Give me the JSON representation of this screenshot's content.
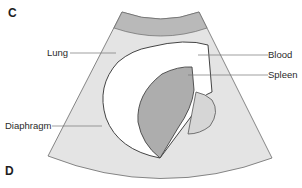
{
  "figure": {
    "panel_top": "C",
    "panel_bottom": "D",
    "labels": {
      "lung": "Lung",
      "blood": "Blood",
      "spleen": "Spleen",
      "diaphragm": "Diaphragm"
    },
    "colors": {
      "sector_fill": "#e4e4e4",
      "near_field_band": "#b9b9b9",
      "blood_fill": "#ffffff",
      "spleen_fill": "#adadad",
      "spleen_lobe_fill": "#d6d6d6",
      "outline": "#555555",
      "leader_line": "#777777"
    }
  }
}
